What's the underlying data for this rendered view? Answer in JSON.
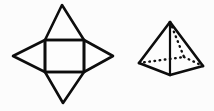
{
  "canvas": {
    "width": 214,
    "height": 111,
    "background_color": "#fcfcfc",
    "ink_color": "#0d0d0d",
    "face_color": "#fdfdfd"
  },
  "figure": {
    "description": "Two black line drawings on a white background: at left the unfolded net of a square pyramid (a square with four triangles attached to its sides, forming a four pointed star), at right the same square pyramid drawn as a three dimensional solid with dotted hidden edges.",
    "shape_count": "2"
  },
  "net": {
    "name": "square-pyramid-net",
    "label": "Net of a square pyramid",
    "outline_points": "62,5 84,40 113,56 84,72 63,103 45,72 13,56 45,40",
    "square": {
      "label": "Square base face",
      "points": "45,40 84,40 84,72 45,72",
      "left": 45,
      "top": 40,
      "right": 84,
      "bottom": 72
    },
    "triangles": [
      {
        "name": "net-triangle-top",
        "label": "Top triangular face",
        "points": "45,40 84,40 62,5",
        "apex_x": 62,
        "apex_y": 5
      },
      {
        "name": "net-triangle-right",
        "label": "Right triangular face",
        "points": "84,40 84,72 113,56",
        "apex_x": 113,
        "apex_y": 56
      },
      {
        "name": "net-triangle-bottom",
        "label": "Bottom triangular face",
        "points": "45,72 84,72 63,103",
        "apex_x": 63,
        "apex_y": 103
      },
      {
        "name": "net-triangle-left",
        "label": "Left triangular face",
        "points": "45,40 45,72 13,56",
        "apex_x": 13,
        "apex_y": 56
      }
    ]
  },
  "solid": {
    "name": "square-pyramid-solid",
    "label": "Square pyramid solid",
    "vertices": {
      "apex": {
        "label": "Apex",
        "x": 170,
        "y": 22
      },
      "base_left": {
        "label": "Left base vertex",
        "x": 139,
        "y": 63
      },
      "base_front": {
        "label": "Front base vertex",
        "x": 170,
        "y": 75
      },
      "base_right": {
        "label": "Right base vertex",
        "x": 203,
        "y": 66
      },
      "base_back": {
        "label": "Hidden back base vertex",
        "x": 184,
        "y": 57
      }
    },
    "visible_edges": [
      {
        "name": "edge-apex-to-base-left",
        "from": "apex",
        "to": "base_left"
      },
      {
        "name": "edge-apex-to-base-right",
        "from": "apex",
        "to": "base_right"
      },
      {
        "name": "edge-apex-to-base-front",
        "from": "apex",
        "to": "base_front"
      },
      {
        "name": "edge-base-left-to-base-front",
        "from": "base_left",
        "to": "base_front"
      },
      {
        "name": "edge-base-front-to-base-right",
        "from": "base_front",
        "to": "base_right"
      }
    ],
    "hidden_edges": [
      {
        "name": "hidden-edge-apex-to-base-back",
        "from": "apex",
        "to": "base_back",
        "style": "dotted"
      },
      {
        "name": "hidden-edge-base-left-to-base-back",
        "from": "base_left",
        "to": "base_back",
        "style": "dotted"
      },
      {
        "name": "hidden-edge-base-back-to-base-right",
        "from": "base_back",
        "to": "base_right",
        "style": "dotted"
      }
    ],
    "outline_points": "170,22 203,66 170,75 139,63"
  }
}
